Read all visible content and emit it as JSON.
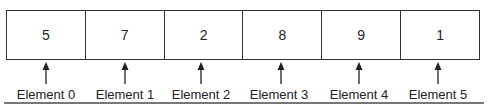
{
  "diagram": {
    "type": "array",
    "cells": [
      {
        "value": "5",
        "label": "Element 0"
      },
      {
        "value": "7",
        "label": "Element 1"
      },
      {
        "value": "2",
        "label": "Element 2"
      },
      {
        "value": "8",
        "label": "Element 3"
      },
      {
        "value": "9",
        "label": "Element 4"
      },
      {
        "value": "1",
        "label": "Element 5"
      }
    ]
  }
}
